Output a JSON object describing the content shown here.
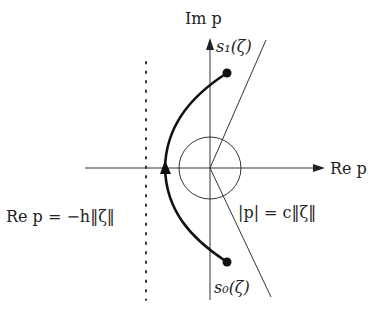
{
  "diagram": {
    "type": "complex-plane contour",
    "axes": {
      "vertical_label": "Im p",
      "horizontal_label": "Re p",
      "origin": [
        210,
        168
      ]
    },
    "labels": {
      "s1": "s₁(ζ)",
      "s0": "s₀(ζ)",
      "circle": "|p| = c‖ζ‖",
      "vertical_line": "Re p = −h‖ζ‖"
    },
    "elements": {
      "circle_radius": 31,
      "dotted_line_x": 146,
      "upper_ray_end": [
        266,
        40
      ],
      "lower_ray_end": [
        271,
        297
      ],
      "contour_start": [
        227,
        262
      ],
      "contour_end": [
        227,
        73
      ],
      "contour_leftmost": [
        165,
        168
      ]
    },
    "colors": {
      "line": "#333333",
      "contour": "#111111"
    }
  }
}
